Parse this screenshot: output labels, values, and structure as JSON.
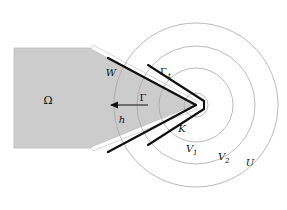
{
  "figure": {
    "type": "math-diagram",
    "background_color": "#ffffff",
    "omega_fill": "#cccccc",
    "omega_stroke": "#9a9a9a",
    "circle_stroke": "#a8a8a8",
    "bold_stroke": "#101010",
    "arrow_color": "#101010"
  },
  "labels": {
    "omega": "Ω",
    "w": "W",
    "gamma": "Γ",
    "gamma_t_base": "Γ",
    "gamma_t_sub": "t",
    "h": "h",
    "k": "K",
    "v1_base": "V",
    "v1_sub": "1",
    "v2_base": "V",
    "v2_sub": "2",
    "u": "U"
  },
  "geometry": {
    "apex_x": 196,
    "apex_y": 105,
    "circle_radii": [
      12,
      37,
      59,
      82
    ],
    "circle_names": [
      "K",
      "V1",
      "V2",
      "U"
    ],
    "omega_polygon": "14,48 90,48 196,105 90,148 14,148",
    "wedge_upper_angle_deg": -28,
    "wedge_lower_angle_deg": 28,
    "arrow_from_x": 148,
    "arrow_from_y": 105,
    "arrow_to_x": 110,
    "arrow_to_y": 105
  },
  "label_positions": {
    "omega": {
      "x": 48,
      "y": 104
    },
    "w": {
      "x": 111,
      "y": 76
    },
    "gamma": {
      "x": 143,
      "y": 101
    },
    "gamma_t": {
      "x": 162,
      "y": 75
    },
    "h": {
      "x": 122,
      "y": 122
    },
    "k": {
      "x": 182,
      "y": 131
    },
    "v1": {
      "x": 190,
      "y": 152
    },
    "v2": {
      "x": 222,
      "y": 160
    },
    "u": {
      "x": 248,
      "y": 165
    }
  }
}
